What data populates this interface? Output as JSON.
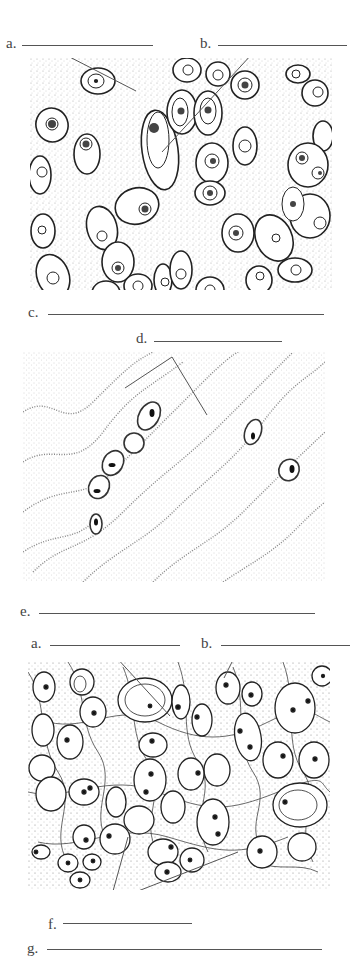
{
  "worksheet": {
    "panels": [
      {
        "id": "hyaline",
        "labels": [
          {
            "letter": "a.",
            "answer": ""
          },
          {
            "letter": "b.",
            "answer": ""
          }
        ],
        "caption": {
          "letter": "c.",
          "answer": ""
        }
      },
      {
        "id": "dense",
        "labels": [
          {
            "letter": "d.",
            "answer": ""
          }
        ],
        "caption": {
          "letter": "e.",
          "answer": ""
        }
      },
      {
        "id": "elastic",
        "labels": [
          {
            "letter": "a.",
            "answer": ""
          },
          {
            "letter": "b.",
            "answer": ""
          },
          {
            "letter": "f.",
            "answer": ""
          }
        ],
        "caption": {
          "letter": "g.",
          "answer": ""
        }
      }
    ]
  },
  "colors": {
    "ink": "#333333",
    "line": "#555555",
    "stipple": "#9a9a9a",
    "background": "#ffffff"
  }
}
